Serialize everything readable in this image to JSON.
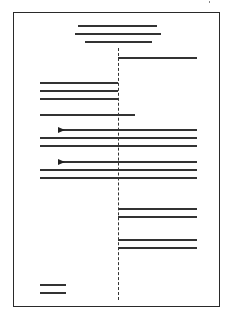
{
  "diagram": {
    "page_border": {
      "left": 13,
      "top": 12,
      "right": 220,
      "bottom": 307
    },
    "center_axis": {
      "x": 118,
      "y_start": 48,
      "y_end": 300,
      "style": "dashed"
    },
    "title_lines": [
      {
        "x1": 78,
        "x2": 157,
        "y": 25
      },
      {
        "x1": 75,
        "x2": 161,
        "y": 33
      },
      {
        "x1": 85,
        "x2": 152,
        "y": 41
      }
    ],
    "lines": [
      {
        "x1": 118,
        "x2": 197,
        "y": 57
      },
      {
        "x1": 40,
        "x2": 118,
        "y": 82
      },
      {
        "x1": 40,
        "x2": 118,
        "y": 90
      },
      {
        "x1": 40,
        "x2": 118,
        "y": 98
      },
      {
        "x1": 40,
        "x2": 135,
        "y": 114
      },
      {
        "x1": 59,
        "x2": 197,
        "y": 129,
        "arrow": true
      },
      {
        "x1": 40,
        "x2": 197,
        "y": 137
      },
      {
        "x1": 40,
        "x2": 197,
        "y": 145
      },
      {
        "x1": 59,
        "x2": 197,
        "y": 161,
        "arrow": true
      },
      {
        "x1": 40,
        "x2": 197,
        "y": 169
      },
      {
        "x1": 40,
        "x2": 197,
        "y": 177
      },
      {
        "x1": 118,
        "x2": 197,
        "y": 208
      },
      {
        "x1": 118,
        "x2": 197,
        "y": 216
      },
      {
        "x1": 118,
        "x2": 197,
        "y": 239
      },
      {
        "x1": 118,
        "x2": 197,
        "y": 247
      },
      {
        "x1": 40,
        "x2": 66,
        "y": 284
      },
      {
        "x1": 40,
        "x2": 66,
        "y": 292
      }
    ],
    "colors": {
      "line": "#333333",
      "border": "#2a2a2a",
      "background": "#ffffff"
    }
  }
}
